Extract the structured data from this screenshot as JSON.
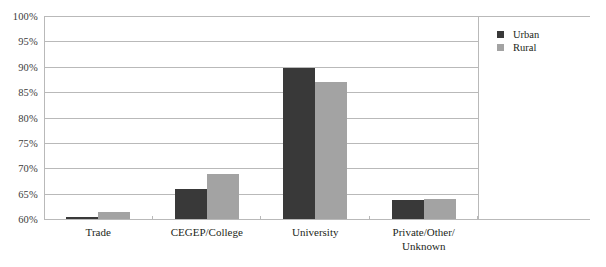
{
  "chart_data": {
    "type": "bar",
    "title": "",
    "subtitle": "",
    "xlabel": "",
    "ylabel": "",
    "categories": [
      "Trade",
      "CEGEP/College",
      "University",
      "Private/Other/Unknown"
    ],
    "category_lines": [
      [
        "Trade"
      ],
      [
        "CEGEP/College"
      ],
      [
        "University"
      ],
      [
        "Private/Other/",
        "Unknown"
      ]
    ],
    "series": [
      {
        "name": "Urban",
        "color": "#393939",
        "values": [
          60.3,
          66.0,
          89.8,
          63.7
        ]
      },
      {
        "name": "Rural",
        "color": "#a3a3a3",
        "values": [
          61.3,
          68.8,
          87.0,
          64.0
        ]
      }
    ],
    "ylim": [
      60,
      100
    ],
    "ytick_step": 5,
    "ytick_labels": [
      "100%",
      "95%",
      "90%",
      "85%",
      "80%",
      "75%",
      "70%",
      "65%",
      "60%"
    ],
    "ytick_values": [
      100,
      95,
      90,
      85,
      80,
      75,
      70,
      65,
      60
    ],
    "value_format": "percent",
    "grid": "horizontal",
    "legend_position": "right",
    "legend": [
      {
        "label": "Urban",
        "swatch": "urban-swatch"
      },
      {
        "label": "Rural",
        "swatch": "rural-swatch"
      }
    ]
  },
  "colors": {
    "urban": "#393939",
    "rural": "#a3a3a3",
    "gridline": "#b9b9b9",
    "text": "#231f20",
    "background": "#ffffff"
  }
}
